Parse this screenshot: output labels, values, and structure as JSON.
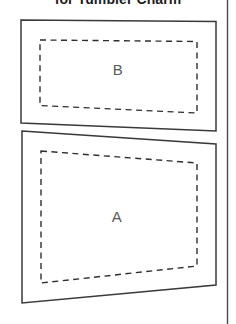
{
  "document": {
    "title": "for Tumbler Charm",
    "background_color": "#ffffff",
    "width": 236,
    "height": 324
  },
  "style": {
    "outline_color": "#3a3a3a",
    "seamline_color": "#2e2e2e",
    "label_color": "#5a5a5a",
    "page_edge_color": "#4a4a4a",
    "title_color": "#1c1c1c"
  },
  "page_edge": {
    "name": "right-page-edge",
    "x": 227.5,
    "y1": 0,
    "y2": 324
  },
  "pieces": [
    {
      "id": "piece-b",
      "label": "B",
      "label_x": 118,
      "label_y": 71,
      "outline_points": "21,20 216,21.5 216,131 21,123",
      "seamline_points": "40,40 197,41.5 197,113 40,105.5"
    },
    {
      "id": "piece-a",
      "label": "A",
      "label_x": 117,
      "label_y": 218,
      "outline_points": "22,131 216,144 216,285 22,303",
      "seamline_points": "41,151 197,163 197,266 41,283"
    }
  ]
}
